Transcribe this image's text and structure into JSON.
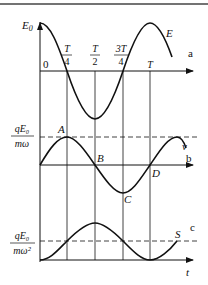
{
  "top_rule": true,
  "panel_a": {
    "label": "a",
    "y_label": {
      "base": "E",
      "sub": "0"
    },
    "curve_label": "E",
    "origin_label": "0",
    "ticks": [
      {
        "num": "T",
        "den": "4"
      },
      {
        "num": "T",
        "den": "2"
      },
      {
        "num": "3T",
        "den": "4"
      },
      {
        "single": "T"
      }
    ]
  },
  "panel_b": {
    "label": "b",
    "curve_label": "v",
    "y_label": {
      "num": "qE₀",
      "den": "mω"
    },
    "points": [
      "A",
      "B",
      "C",
      "D"
    ]
  },
  "panel_c": {
    "label": "c",
    "curve_label": "S",
    "y_label": {
      "num": "qE₀",
      "den": "mω²"
    },
    "x_axis_label": "t"
  },
  "colors": {
    "ink": "#111111",
    "background": "#ffffff",
    "rule": "#333333"
  }
}
